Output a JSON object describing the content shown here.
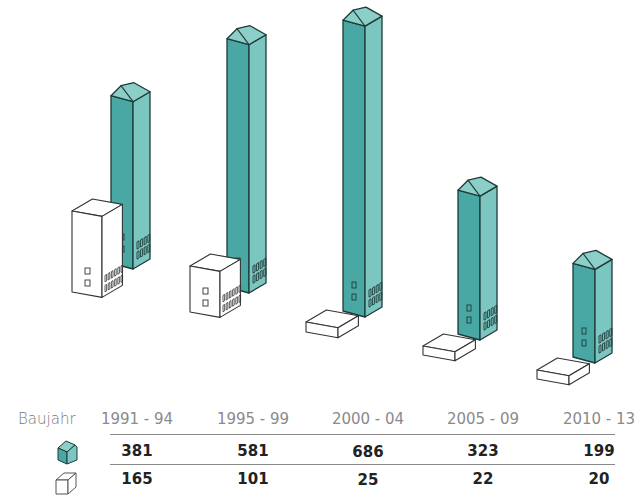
{
  "chart_data": {
    "type": "bar",
    "title": "",
    "xlabel": "Baujahr",
    "ylabel": "",
    "categories": [
      "1991 - 94",
      "1995 - 99",
      "2000 - 04",
      "2005 - 09",
      "2010 - 13"
    ],
    "series": [
      {
        "name": "teal-house",
        "legend_icon": "teal-house-icon",
        "color": "#4aa8a4",
        "values": [
          381,
          581,
          686,
          323,
          199
        ]
      },
      {
        "name": "white-box",
        "legend_icon": "white-box-icon",
        "color": "#ffffff",
        "values": [
          165,
          101,
          25,
          22,
          20
        ]
      }
    ],
    "grid": false,
    "legend_position": "left-of-table"
  },
  "table": {
    "header_label": "Baujahr",
    "columns": [
      "1991 - 94",
      "1995 - 99",
      "2000 - 04",
      "2005 - 09",
      "2010 - 13"
    ],
    "rows": [
      {
        "icon": "teal-house-icon",
        "values": [
          "381",
          "581",
          "686",
          "323",
          "199"
        ]
      },
      {
        "icon": "white-box-icon",
        "values": [
          "165",
          "101",
          "25",
          "22",
          "20"
        ]
      }
    ]
  },
  "colors": {
    "teal_front": "#4aa8a4",
    "teal_side": "#7cc6c1",
    "teal_roof": "#8ccfc9",
    "outline": "#1e3a38",
    "text_dark": "#222222",
    "text_light": "#8a8a8a"
  }
}
